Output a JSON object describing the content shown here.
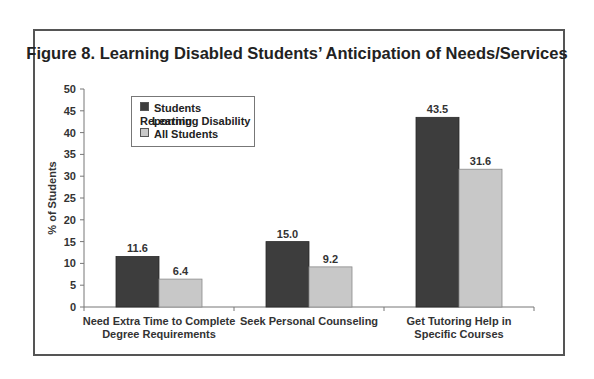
{
  "figure": {
    "title": "Figure 8. Learning Disabled Students’ Anticipation of Needs/Services"
  },
  "colors": {
    "series_dark": "#3d3d3d",
    "series_light": "#c8c8c8",
    "frame": "#555555",
    "axis": "#777777"
  },
  "legend": {
    "items": [
      {
        "line1": "Students Reporting",
        "line2": "Learning Disability",
        "color": "#3d3d3d"
      },
      {
        "line1": "All Students",
        "line2": "",
        "color": "#c8c8c8"
      }
    ]
  },
  "chart_data": {
    "type": "bar",
    "title": "Figure 8. Learning Disabled Students’ Anticipation of Needs/Services",
    "xlabel": "",
    "ylabel": "% of Students",
    "ylim": [
      0,
      50
    ],
    "yticks": [
      0,
      5,
      10,
      15,
      20,
      25,
      30,
      35,
      40,
      45,
      50
    ],
    "grid": false,
    "legend_position": "upper-left inside",
    "categories": [
      "Need Extra Time to Complete Degree Requirements",
      "Seek Personal Counseling",
      "Get Tutoring Help in Specific Courses"
    ],
    "category_lines": [
      [
        "Need Extra Time to Complete",
        "Degree Requirements"
      ],
      [
        "Seek Personal Counseling"
      ],
      [
        "Get Tutoring Help in",
        "Specific Courses"
      ]
    ],
    "series": [
      {
        "name": "Students Reporting Learning Disability",
        "values": [
          11.6,
          15.0,
          43.5
        ],
        "labels": [
          "11.6",
          "15.0",
          "43.5"
        ]
      },
      {
        "name": "All Students",
        "values": [
          6.4,
          9.2,
          31.6
        ],
        "labels": [
          "6.4",
          "9.2",
          "31.6"
        ]
      }
    ]
  }
}
